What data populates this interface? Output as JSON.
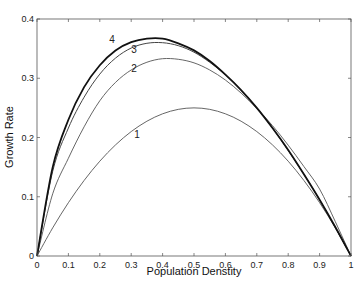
{
  "chart_data": {
    "type": "line",
    "title": "",
    "xlabel": "Population Denstity",
    "ylabel": "Growth Rate",
    "xlim": [
      0,
      1
    ],
    "ylim": [
      0,
      0.4
    ],
    "xticks": [
      "0",
      "0.1",
      "0.2",
      "0.3",
      "0.4",
      "0.5",
      "0.6",
      "0.7",
      "0.8",
      "0.9",
      "1"
    ],
    "yticks": [
      "0",
      "0.1",
      "0.2",
      "0.3",
      "0.4"
    ],
    "grid": false,
    "legend": "none (inline curve labels 1-4)",
    "x": [
      0,
      0.05,
      0.1,
      0.15,
      0.2,
      0.25,
      0.3,
      0.35,
      0.4,
      0.45,
      0.5,
      0.55,
      0.6,
      0.65,
      0.7,
      0.75,
      0.8,
      0.85,
      0.9,
      0.95,
      1.0
    ],
    "series": [
      {
        "name": "1",
        "peak": {
          "x": 0.5,
          "y": 0.25
        },
        "values": [
          0,
          0.0475,
          0.09,
          0.1275,
          0.16,
          0.1875,
          0.21,
          0.2275,
          0.24,
          0.2475,
          0.25,
          0.2475,
          0.24,
          0.2275,
          0.21,
          0.1875,
          0.16,
          0.1275,
          0.09,
          0.0475,
          0
        ]
      },
      {
        "name": "2",
        "peak": {
          "x": 0.41,
          "y": 0.333
        },
        "values": [
          0,
          0.105,
          0.165,
          0.218,
          0.262,
          0.293,
          0.314,
          0.327,
          0.333,
          0.332,
          0.326,
          0.314,
          0.297,
          0.275,
          0.249,
          0.22,
          0.187,
          0.151,
          0.113,
          0.058,
          0
        ]
      },
      {
        "name": "3",
        "peak": {
          "x": 0.38,
          "y": 0.359
        },
        "values": [
          0,
          0.143,
          0.216,
          0.268,
          0.307,
          0.334,
          0.351,
          0.359,
          0.36,
          0.355,
          0.344,
          0.327,
          0.306,
          0.28,
          0.25,
          0.216,
          0.178,
          0.138,
          0.095,
          0.048,
          0
        ]
      },
      {
        "name": "4",
        "peak": {
          "x": 0.368,
          "y": 0.368
        },
        "values": [
          0,
          0.15,
          0.23,
          0.285,
          0.322,
          0.347,
          0.361,
          0.367,
          0.367,
          0.359,
          0.347,
          0.329,
          0.306,
          0.28,
          0.25,
          0.216,
          0.179,
          0.138,
          0.095,
          0.049,
          0
        ]
      }
    ],
    "series_styles": {
      "1": {
        "color": "#555555",
        "width": 0.9
      },
      "2": {
        "color": "#555555",
        "width": 0.9
      },
      "3": {
        "color": "#444444",
        "width": 1.0
      },
      "4": {
        "color": "#111111",
        "width": 1.8
      }
    },
    "curve_label_positions": {
      "1": {
        "x": 0.31,
        "y": 0.2
      },
      "2": {
        "x": 0.3,
        "y": 0.31
      },
      "3": {
        "x": 0.3,
        "y": 0.343
      },
      "4": {
        "x": 0.23,
        "y": 0.36
      }
    }
  }
}
